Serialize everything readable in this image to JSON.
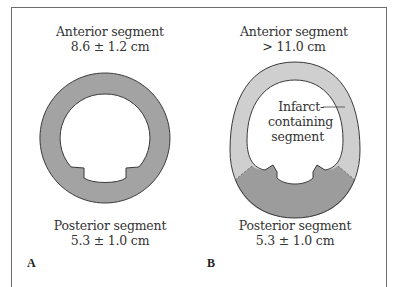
{
  "panels": [
    {
      "letter": "A",
      "anterior": {
        "label": "Anterior segment",
        "value": "8.6 ± 1.2 cm"
      },
      "posterior": {
        "label": "Posterior segment",
        "value": "5.3 ± 1.0 cm"
      }
    },
    {
      "letter": "B",
      "anterior": {
        "label": "Anterior segment",
        "value": "> 11.0 cm"
      },
      "posterior": {
        "label": "Posterior segment",
        "value": "5.3 ± 1.0 cm"
      },
      "callout": {
        "line1": "Infarct-",
        "line2": "containing",
        "line3": "segment"
      }
    }
  ],
  "colors": {
    "normal_wall": "#a3a3a3",
    "infarct_wall": "#cfcfcf",
    "posterior_wall_b": "#9c9c9c",
    "outline": "#3a3a3a",
    "frame": "#6f6f6f"
  }
}
